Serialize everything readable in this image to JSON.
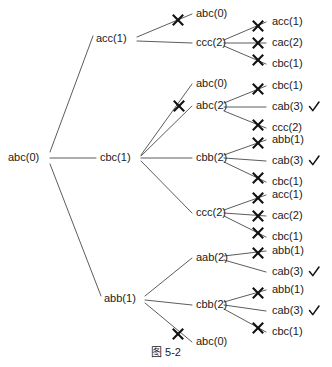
{
  "figure": {
    "caption": "图 5-2",
    "root": {
      "label": "abc(0)",
      "x": 8,
      "y": 158
    },
    "level1": [
      {
        "name": "acc(1)",
        "label": "acc(1)",
        "x": 96,
        "y": 39
      },
      {
        "name": "cbc(1)",
        "label": "cbc(1)",
        "x": 100,
        "y": 158
      },
      {
        "name": "abb(1)",
        "label": "abb(1)",
        "x": 104,
        "y": 299
      }
    ],
    "level2": [
      {
        "name": "acc-child-1",
        "label": "abc(0)",
        "x": 196,
        "y": 14,
        "pruned": true
      },
      {
        "name": "acc-child-2",
        "label": "ccc(2)",
        "x": 196,
        "y": 43,
        "pruned": false
      },
      {
        "name": "cbc-child-1",
        "label": "abc(0)",
        "x": 196,
        "y": 84,
        "pruned": true
      },
      {
        "name": "cbc-child-2",
        "label": "abc(2)",
        "x": 196,
        "y": 106,
        "pruned": false
      },
      {
        "name": "cbc-child-3",
        "label": "cbb(2)",
        "x": 196,
        "y": 158,
        "pruned": false
      },
      {
        "name": "cbc-child-4",
        "label": "ccc(2)",
        "x": 196,
        "y": 213,
        "pruned": false
      },
      {
        "name": "abb-child-1",
        "label": "aab(2)",
        "x": 196,
        "y": 258,
        "pruned": false
      },
      {
        "name": "abb-child-2",
        "label": "cbb(2)",
        "x": 196,
        "y": 305,
        "pruned": false
      },
      {
        "name": "abb-child-3",
        "label": "abc(0)",
        "x": 196,
        "y": 342,
        "pruned": true
      }
    ],
    "level3": [
      {
        "name": "ccc2-a-child-1",
        "label": "acc(1)",
        "x": 272,
        "y": 22,
        "pruned": true,
        "accepted": false
      },
      {
        "name": "ccc2-a-child-2",
        "label": "cac(2)",
        "x": 272,
        "y": 43,
        "pruned": true,
        "accepted": false
      },
      {
        "name": "ccc2-a-child-3",
        "label": "cbc(1)",
        "x": 272,
        "y": 64,
        "pruned": true,
        "accepted": false
      },
      {
        "name": "abc2-child-1",
        "label": "cbc(1)",
        "x": 272,
        "y": 86,
        "pruned": true,
        "accepted": false
      },
      {
        "name": "abc2-child-2",
        "label": "cab(3)",
        "x": 272,
        "y": 107,
        "pruned": false,
        "accepted": true
      },
      {
        "name": "abc2-child-3",
        "label": "ccc(2)",
        "x": 272,
        "y": 128,
        "pruned": true,
        "accepted": false
      },
      {
        "name": "cbb2-a-child-1",
        "label": "abb(1)",
        "x": 272,
        "y": 140,
        "pruned": true,
        "accepted": false
      },
      {
        "name": "cbb2-a-child-2",
        "label": "cab(3)",
        "x": 272,
        "y": 161,
        "pruned": false,
        "accepted": true
      },
      {
        "name": "cbb2-a-child-3",
        "label": "cbc(1)",
        "x": 272,
        "y": 182,
        "pruned": true,
        "accepted": false
      },
      {
        "name": "ccc2-b-child-1",
        "label": "acc(1)",
        "x": 272,
        "y": 195,
        "pruned": true,
        "accepted": false
      },
      {
        "name": "ccc2-b-child-2",
        "label": "cac(2)",
        "x": 272,
        "y": 216,
        "pruned": true,
        "accepted": false
      },
      {
        "name": "ccc2-b-child-3",
        "label": "cbc(1)",
        "x": 272,
        "y": 237,
        "pruned": true,
        "accepted": false
      },
      {
        "name": "aab2-child-1",
        "label": "abb(1)",
        "x": 272,
        "y": 251,
        "pruned": true,
        "accepted": false
      },
      {
        "name": "aab2-child-2",
        "label": "cab(3)",
        "x": 272,
        "y": 272,
        "pruned": false,
        "accepted": true
      },
      {
        "name": "cbb2-b-child-1",
        "label": "abb(1)",
        "x": 272,
        "y": 290,
        "pruned": true,
        "accepted": false
      },
      {
        "name": "cbb2-b-child-2",
        "label": "cab(3)",
        "x": 272,
        "y": 311,
        "pruned": false,
        "accepted": true
      },
      {
        "name": "cbb2-b-child-3",
        "label": "cbc(1)",
        "x": 272,
        "y": 332,
        "pruned": true,
        "accepted": false
      }
    ],
    "edges": [
      {
        "name": "edge-root-acc1",
        "x1": 50,
        "y1": 152,
        "x2": 93,
        "y2": 36
      },
      {
        "name": "edge-root-cbc1",
        "x1": 50,
        "y1": 158,
        "x2": 96,
        "y2": 158
      },
      {
        "name": "edge-root-abb1",
        "x1": 50,
        "y1": 164,
        "x2": 101,
        "y2": 296
      },
      {
        "name": "edge-acc1-abc0",
        "x1": 137,
        "y1": 37,
        "x2": 192,
        "y2": 14
      },
      {
        "name": "edge-acc1-ccc2",
        "x1": 137,
        "y1": 41,
        "x2": 192,
        "y2": 43
      },
      {
        "name": "edge-ccc2a-acc1",
        "x1": 224,
        "y1": 40,
        "x2": 266,
        "y2": 22
      },
      {
        "name": "edge-ccc2a-cac2",
        "x1": 224,
        "y1": 43,
        "x2": 266,
        "y2": 43
      },
      {
        "name": "edge-ccc2a-cbc1",
        "x1": 224,
        "y1": 46,
        "x2": 266,
        "y2": 64
      },
      {
        "name": "edge-cbc1-abc0",
        "x1": 141,
        "y1": 155,
        "x2": 192,
        "y2": 84
      },
      {
        "name": "edge-cbc1-abc2",
        "x1": 141,
        "y1": 156,
        "x2": 192,
        "y2": 106
      },
      {
        "name": "edge-cbc1-cbb2",
        "x1": 141,
        "y1": 158,
        "x2": 192,
        "y2": 158
      },
      {
        "name": "edge-cbc1-ccc2",
        "x1": 141,
        "y1": 161,
        "x2": 192,
        "y2": 213
      },
      {
        "name": "edge-abc2-cbc1",
        "x1": 224,
        "y1": 103,
        "x2": 266,
        "y2": 86
      },
      {
        "name": "edge-abc2-cab3",
        "x1": 224,
        "y1": 107,
        "x2": 266,
        "y2": 107
      },
      {
        "name": "edge-abc2-ccc2",
        "x1": 224,
        "y1": 111,
        "x2": 266,
        "y2": 128
      },
      {
        "name": "edge-cbb2a-abb1",
        "x1": 224,
        "y1": 155,
        "x2": 266,
        "y2": 140
      },
      {
        "name": "edge-cbb2a-cab3",
        "x1": 224,
        "y1": 158,
        "x2": 266,
        "y2": 161
      },
      {
        "name": "edge-cbb2a-cbc1",
        "x1": 224,
        "y1": 162,
        "x2": 266,
        "y2": 182
      },
      {
        "name": "edge-ccc2b-acc1",
        "x1": 224,
        "y1": 210,
        "x2": 266,
        "y2": 195
      },
      {
        "name": "edge-ccc2b-cac2",
        "x1": 224,
        "y1": 213,
        "x2": 266,
        "y2": 216
      },
      {
        "name": "edge-ccc2b-cbc1",
        "x1": 224,
        "y1": 216,
        "x2": 266,
        "y2": 237
      },
      {
        "name": "edge-abb1-aab2",
        "x1": 145,
        "y1": 296,
        "x2": 192,
        "y2": 258
      },
      {
        "name": "edge-abb1-cbb2",
        "x1": 145,
        "y1": 300,
        "x2": 192,
        "y2": 305
      },
      {
        "name": "edge-abb1-abc0",
        "x1": 145,
        "y1": 303,
        "x2": 192,
        "y2": 342
      },
      {
        "name": "edge-aab2-abb1",
        "x1": 224,
        "y1": 256,
        "x2": 266,
        "y2": 251
      },
      {
        "name": "edge-aab2-cab3",
        "x1": 224,
        "y1": 260,
        "x2": 266,
        "y2": 272
      },
      {
        "name": "edge-cbb2b-abb1",
        "x1": 224,
        "y1": 302,
        "x2": 266,
        "y2": 290
      },
      {
        "name": "edge-cbb2b-cab3",
        "x1": 224,
        "y1": 305,
        "x2": 266,
        "y2": 311
      },
      {
        "name": "edge-cbb2b-cbc1",
        "x1": 224,
        "y1": 309,
        "x2": 266,
        "y2": 332
      }
    ],
    "xmarks": [
      {
        "name": "xmark-acc1-abc0",
        "x": 178,
        "y": 20
      },
      {
        "name": "xmark-ccc2a-acc1",
        "x": 258,
        "y": 26
      },
      {
        "name": "xmark-ccc2a-cac2",
        "x": 258,
        "y": 43
      },
      {
        "name": "xmark-ccc2a-cbc1",
        "x": 258,
        "y": 60
      },
      {
        "name": "xmark-cbc1-abc0",
        "x": 179,
        "y": 106
      },
      {
        "name": "xmark-abc2-cbc1",
        "x": 258,
        "y": 89
      },
      {
        "name": "xmark-abc2-ccc2",
        "x": 258,
        "y": 125
      },
      {
        "name": "xmark-cbb2a-abb1",
        "x": 258,
        "y": 143
      },
      {
        "name": "xmark-cbb2a-cbc1",
        "x": 258,
        "y": 178
      },
      {
        "name": "xmark-ccc2b-acc1",
        "x": 258,
        "y": 198
      },
      {
        "name": "xmark-ccc2b-cac2",
        "x": 258,
        "y": 216
      },
      {
        "name": "xmark-ccc2b-cbc1",
        "x": 258,
        "y": 233
      },
      {
        "name": "xmark-aab2-abb1",
        "x": 258,
        "y": 253
      },
      {
        "name": "xmark-cbb2b-abb1",
        "x": 258,
        "y": 293
      },
      {
        "name": "xmark-cbb2b-cbc1",
        "x": 258,
        "y": 328
      },
      {
        "name": "xmark-abb1-abc0",
        "x": 178,
        "y": 334
      }
    ],
    "checkmarks": [
      {
        "name": "checkmark-abc2-cab3",
        "x": 314,
        "y": 107
      },
      {
        "name": "checkmark-cbb2a-cab3",
        "x": 314,
        "y": 161
      },
      {
        "name": "checkmark-aab2-cab3",
        "x": 314,
        "y": 272
      },
      {
        "name": "checkmark-cbb2b-cab3",
        "x": 314,
        "y": 311
      }
    ],
    "caption_pos": {
      "x": 166,
      "y": 356
    }
  }
}
